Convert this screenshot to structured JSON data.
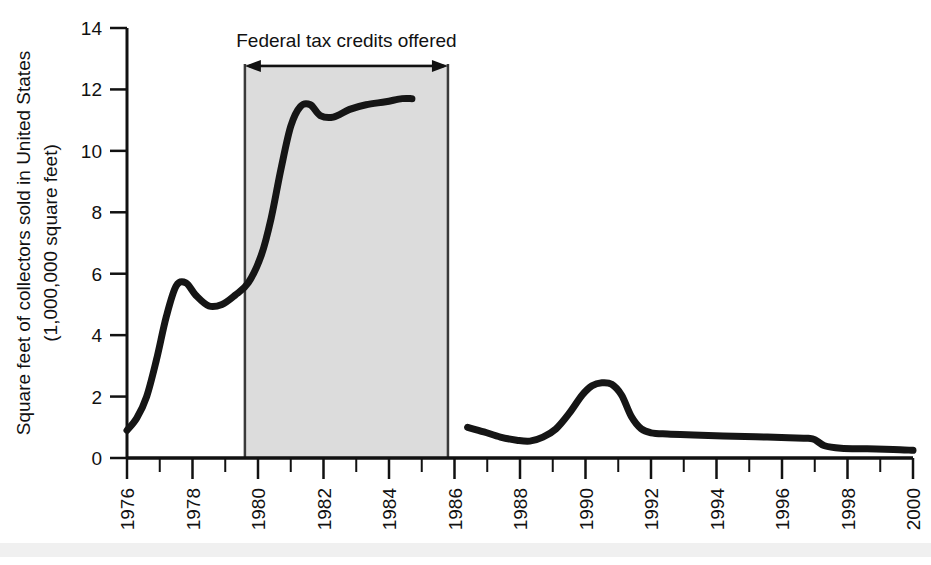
{
  "chart_data": {
    "type": "line",
    "title": "",
    "xlabel": "",
    "ylabel_line1": "Square feet of collectors sold in United States",
    "ylabel_line2": "(1,000,000 square feet)",
    "xlim": [
      1976,
      2000
    ],
    "ylim": [
      0,
      14
    ],
    "yticks": [
      0,
      2,
      4,
      6,
      8,
      10,
      12,
      14
    ],
    "ytick_labels": [
      "0",
      "2",
      "4",
      "6",
      "8",
      "10",
      "12",
      "14"
    ],
    "xticks": [
      1976,
      1978,
      1980,
      1982,
      1984,
      1986,
      1988,
      1990,
      1992,
      1994,
      1996,
      1998,
      2000
    ],
    "xtick_labels": [
      "1976",
      "1978",
      "1980",
      "1982",
      "1984",
      "1986",
      "1988",
      "1990",
      "1992",
      "1994",
      "1996",
      "1998",
      "2000"
    ],
    "xtick_minor_step": 1,
    "grid": false,
    "legend": "none",
    "line_color": "#151515",
    "line_width": 7,
    "series": [
      {
        "name": "Collector sales (1976-1985)",
        "x": [
          1976.0,
          1976.3,
          1976.6,
          1976.9,
          1977.2,
          1977.5,
          1977.8,
          1978.1,
          1978.5,
          1978.9,
          1979.3,
          1979.7,
          1980.1,
          1980.4,
          1980.7,
          1981.0,
          1981.3,
          1981.6,
          1981.9,
          1982.3,
          1982.8,
          1983.3,
          1983.9,
          1984.4,
          1984.7
        ],
        "values": [
          0.9,
          1.3,
          2.0,
          3.2,
          4.6,
          5.6,
          5.7,
          5.3,
          4.95,
          5.0,
          5.3,
          5.7,
          6.6,
          7.8,
          9.4,
          10.8,
          11.45,
          11.5,
          11.15,
          11.1,
          11.35,
          11.5,
          11.6,
          11.7,
          11.7
        ]
      },
      {
        "name": "Collector sales (1986-2000)",
        "x": [
          1986.4,
          1986.9,
          1987.4,
          1987.9,
          1988.3,
          1988.7,
          1989.1,
          1989.5,
          1989.9,
          1990.2,
          1990.5,
          1990.8,
          1991.1,
          1991.4,
          1991.7,
          1992.0,
          1992.5,
          1993.3,
          1994.2,
          1995.2,
          1996.2,
          1996.8,
          1997.0,
          1997.3,
          1997.8,
          1998.6,
          1999.4,
          2000.0
        ],
        "values": [
          1.0,
          0.85,
          0.68,
          0.58,
          0.55,
          0.68,
          0.95,
          1.45,
          2.05,
          2.35,
          2.45,
          2.4,
          2.05,
          1.35,
          0.95,
          0.82,
          0.78,
          0.75,
          0.72,
          0.69,
          0.66,
          0.64,
          0.6,
          0.4,
          0.32,
          0.3,
          0.28,
          0.25
        ]
      }
    ],
    "annotations": [
      {
        "name": "federal-tax-credits-span",
        "label": "Federal tax credits offered",
        "x_start": 1979.6,
        "x_end": 1985.8,
        "shaded": true,
        "shade_color": "#dcdcdc",
        "arrow": "double-headed"
      }
    ]
  }
}
